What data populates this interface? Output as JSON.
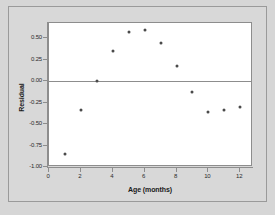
{
  "chart_data": {
    "type": "scatter",
    "title": "",
    "xlabel": "Age (months)",
    "ylabel": "Residual",
    "xlim": [
      0,
      12.8
    ],
    "ylim": [
      -1.0,
      0.68
    ],
    "grid": false,
    "legend": "none",
    "reference_line_y": 0.0,
    "x_ticks": [
      "0",
      "2",
      "4",
      "6",
      "8",
      "10",
      "12"
    ],
    "x_tick_values": [
      0,
      2,
      4,
      6,
      8,
      10,
      12
    ],
    "y_ticks": [
      "0.50",
      "0.25",
      "0.00",
      "-0.25",
      "-0.50",
      "-0.75",
      "-1.00"
    ],
    "y_tick_values": [
      0.5,
      0.25,
      0.0,
      -0.25,
      -0.5,
      -0.75,
      -1.0
    ],
    "marker": "filled-circle",
    "marker_color": "#4a4a4a",
    "x": [
      1,
      2,
      3,
      4,
      5,
      6,
      7,
      8,
      9,
      10,
      11,
      12
    ],
    "values": [
      -0.85,
      -0.33,
      0.0,
      0.35,
      0.57,
      0.6,
      0.45,
      0.18,
      -0.12,
      -0.36,
      -0.33,
      -0.3
    ],
    "points": [
      {
        "x": 1,
        "y": -0.85
      },
      {
        "x": 2,
        "y": -0.33
      },
      {
        "x": 3,
        "y": 0.0
      },
      {
        "x": 4,
        "y": 0.35
      },
      {
        "x": 5,
        "y": 0.57
      },
      {
        "x": 6,
        "y": 0.6
      },
      {
        "x": 7,
        "y": 0.45
      },
      {
        "x": 8,
        "y": 0.18
      },
      {
        "x": 9,
        "y": -0.12
      },
      {
        "x": 10,
        "y": -0.36
      },
      {
        "x": 11,
        "y": -0.33
      },
      {
        "x": 12,
        "y": -0.3
      }
    ]
  },
  "colors": {
    "page_background": "#d6d6d6",
    "panel_background": "#ffffff",
    "axis": "#8d8d8d",
    "marker": "#4a4a4a",
    "text": "#1a1a1a"
  }
}
